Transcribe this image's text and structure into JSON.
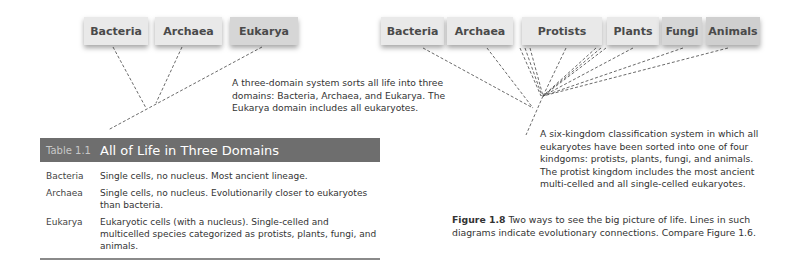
{
  "three_domain_diagram": {
    "boxes": [
      "Bacteria",
      "Archaea",
      "Eukarya"
    ],
    "description": "A three-domain system sorts all life into three domains: Bacteria, Archaea, and Eukarya. The Eukarya domain includes all eukaryotes."
  },
  "six_kingdom_diagram": {
    "boxes": [
      "Bacteria",
      "Archaea",
      "Protists",
      "Plants",
      "Fungi",
      "Animals"
    ],
    "description": "A six-kingdom classification system in which all eukaryotes have been sorted into one of four kindgoms: protists, plants, fungi, and animals. The protist kingdom includes the most ancient multi-celled and all single-celled eukaryotes."
  },
  "table": {
    "label": "Table 1.1",
    "title": "All of Life in Three Domains",
    "rows": [
      {
        "domain": "Bacteria",
        "description": "Single cells, no nucleus. Most ancient lineage."
      },
      {
        "domain": "Archaea",
        "description": "Single cells, no nucleus. Evolutionarily closer to eukaryotes than bacteria."
      },
      {
        "domain": "Eukarya",
        "description": "Eukaryotic cells (with a nucleus). Single-celled and multicelled species categorized as protists, plants, fungi, and animals."
      }
    ]
  },
  "caption": {
    "figure_label": "Figure 1.8",
    "text": "Two ways to see the big picture of life. Lines in such diagrams indicate evolutionary connections. Compare Figure 1.6."
  }
}
